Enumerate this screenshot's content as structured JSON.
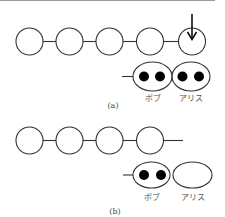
{
  "figure_a": {
    "caption": "(a)",
    "chain_nodes": 5,
    "arrow_on_node": 5,
    "pairs": [
      {
        "label": "ボブ",
        "dots": 2
      },
      {
        "label": "アリス",
        "dots": 2
      }
    ]
  },
  "figure_b": {
    "caption": "(b)",
    "chain_nodes": 4,
    "pairs": [
      {
        "label": "ボブ",
        "dots": 2
      },
      {
        "label": "アリス",
        "dots": 0
      }
    ]
  },
  "colors": {
    "stroke": "#333333",
    "dot": "#000000",
    "label": "#555555"
  }
}
